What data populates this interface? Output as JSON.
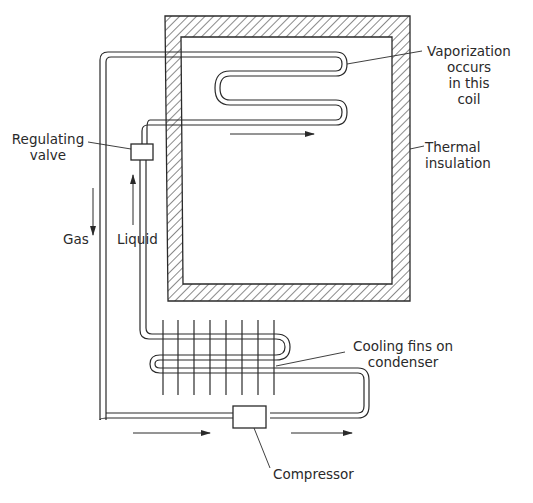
{
  "diagram": {
    "type": "refrigerator-cycle-schematic",
    "colors": {
      "line": "#2a2a2a",
      "background": "#ffffff",
      "hatch": "#3a3a3a"
    },
    "labels": {
      "vaporization": [
        "Vaporization",
        "occurs",
        "in this",
        "coil"
      ],
      "thermal_insulation": [
        "Thermal",
        "insulation"
      ],
      "regulating_valve": [
        "Regulating",
        "valve"
      ],
      "gas": "Gas",
      "liquid": "Liquid",
      "cooling_fins": [
        "Cooling fins on",
        "condenser"
      ],
      "compressor": "Compressor"
    },
    "components": [
      {
        "name": "Thermal insulation box",
        "kind": "hatched-wall"
      },
      {
        "name": "Evaporator coil",
        "kind": "serpentine-tube"
      },
      {
        "name": "Regulating valve",
        "kind": "box"
      },
      {
        "name": "Condenser with cooling fins",
        "kind": "finned-serpentine-tube"
      },
      {
        "name": "Compressor",
        "kind": "box"
      }
    ],
    "flow_arrows": [
      {
        "location": "evaporator inlet",
        "direction": "right"
      },
      {
        "location": "gas line",
        "direction": "down"
      },
      {
        "location": "liquid line",
        "direction": "up"
      },
      {
        "location": "compressor inlet",
        "direction": "right"
      },
      {
        "location": "compressor outlet",
        "direction": "right"
      }
    ]
  }
}
